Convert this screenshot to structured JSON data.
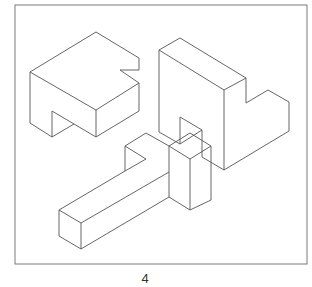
{
  "figure": {
    "caption": "4",
    "frame_color": "#7a7a7a",
    "line_color": "#555555",
    "shapes": [
      {
        "name": "block-with-notches",
        "description": "Isometric block with a corner notch and a bottom arch cutout"
      },
      {
        "name": "step-arch-block",
        "description": "Isometric step-shaped block with arch cutout"
      },
      {
        "name": "t-bar-with-post",
        "description": "Long isometric bar with hooked end and an upright rectangular post"
      }
    ]
  }
}
